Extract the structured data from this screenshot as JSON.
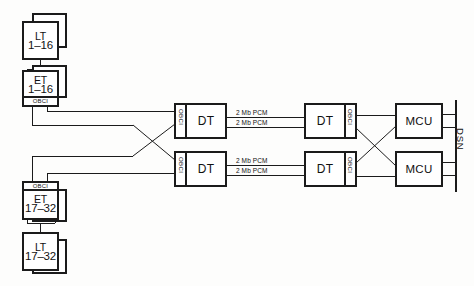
{
  "diagram": {
    "line_color": "#1b1b1b",
    "background": "#fdfdfc"
  },
  "terminals": {
    "top_lt": {
      "type": "LT",
      "range": "1–16"
    },
    "top_et": {
      "type": "ET",
      "range": "1–16"
    },
    "bottom_et": {
      "type": "ET",
      "range": "17–32"
    },
    "bottom_lt": {
      "type": "LT",
      "range": "17–32"
    }
  },
  "interfaces": {
    "obci_label": "OBCI",
    "top_terminal_obci": "OBCI",
    "bottom_terminal_obci": "OBCI",
    "dt_left_top_obci": "OBCI",
    "dt_left_bottom_obci": "OBCI",
    "dt_right_top_obci": "OBCI",
    "dt_right_bottom_obci": "OBCI"
  },
  "nodes": {
    "dt_left_top": "DT",
    "dt_left_bottom": "DT",
    "dt_right_top": "DT",
    "dt_right_bottom": "DT",
    "mcu_top": "MCU",
    "mcu_bottom": "MCU"
  },
  "links": {
    "pcm_top_upper": "2 Mb PCM",
    "pcm_top_lower": "2 Mb PCM",
    "pcm_bottom_upper": "2 Mb PCM",
    "pcm_bottom_lower": "2 Mb PCM"
  },
  "bus": {
    "label": "DSN"
  }
}
